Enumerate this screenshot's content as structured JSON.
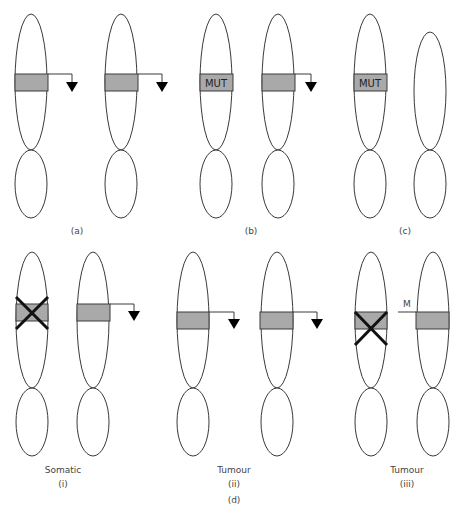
{
  "figure": {
    "colors": {
      "band": "#a9a9a9",
      "outline": "#3a3a3a",
      "cross": "#111111",
      "background": "#ffffff"
    },
    "panels": {
      "a": {
        "label": "(a)"
      },
      "b": {
        "label": "(b)",
        "mutation_text": "MUT"
      },
      "c": {
        "label": "(c)",
        "mutation_text": "MUT"
      },
      "d": {
        "label": "(d)",
        "sub": {
          "i": {
            "title": "Somatic",
            "label": "(i)"
          },
          "ii": {
            "title": "Tumour",
            "label": "(ii)"
          },
          "iii": {
            "title": "Tumour",
            "label": "(iii)",
            "marker_text": "M"
          }
        }
      }
    }
  }
}
